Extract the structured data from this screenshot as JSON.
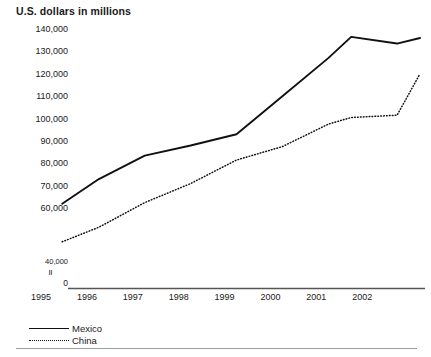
{
  "chart_data": {
    "type": "line",
    "title": "U.S. dollars in millions",
    "xlabel": "",
    "ylabel": "U.S. dollars in millions",
    "grid": false,
    "legend_position": "bottom-left",
    "axis_break": {
      "present": true,
      "mark": "II",
      "break_label": "40,000",
      "zero_label": "0"
    },
    "ylim": [
      40000,
      140000
    ],
    "yticks": [
      140000,
      130000,
      120000,
      110000,
      100000,
      90000,
      80000,
      70000,
      60000
    ],
    "ytick_labels": [
      "140,000",
      "130,000",
      "120,000",
      "110,000",
      "100,000",
      "90,000",
      "80,000",
      "70,000",
      "60,000"
    ],
    "xlim": [
      1995,
      2003
    ],
    "xticks": [
      1995,
      1996,
      1997,
      1998,
      1999,
      2000,
      2001,
      2002
    ],
    "xtick_labels": [
      "1995",
      "1996",
      "1997",
      "1998",
      "1999",
      "2000",
      "2001",
      "2002"
    ],
    "x": [
      1995.2,
      1996,
      1997,
      1998,
      1999,
      2000,
      2001,
      2001.5,
      2002.5,
      2003
    ],
    "series": [
      {
        "name": "Mexico",
        "style": "solid",
        "color": "#111111",
        "values": [
          62000,
          73000,
          83500,
          88000,
          93000,
          110000,
          127000,
          136500,
          133500,
          136000
        ]
      },
      {
        "name": "China",
        "style": "dotted",
        "color": "#111111",
        "values": [
          45000,
          51500,
          62500,
          71000,
          81500,
          87500,
          97500,
          100500,
          101500,
          120000
        ]
      }
    ]
  },
  "legend": {
    "items": [
      {
        "label": "Mexico",
        "style": "solid"
      },
      {
        "label": "China",
        "style": "dotted"
      }
    ]
  }
}
